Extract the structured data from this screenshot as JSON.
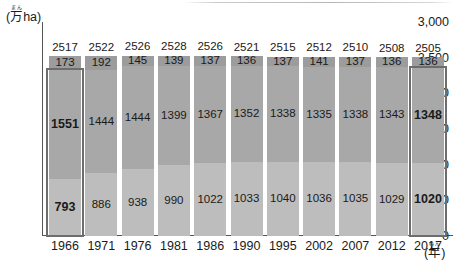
{
  "chart_data": {
    "type": "bar",
    "title": "",
    "ylabel": "(万ha)",
    "ylabel_ruby": "まん",
    "xlabel": "(年)",
    "xlabel_ruby": "ねん",
    "ylim": [
      0,
      3000
    ],
    "yticks": [
      3000,
      2500,
      2000,
      1500,
      1000,
      500,
      0
    ],
    "ytick_labels": [
      "3,000",
      "2,500",
      "2,000",
      "1,500",
      "1,000",
      "500",
      "0"
    ],
    "grid": false,
    "legend": "none",
    "stacked": true,
    "categories": [
      "1966",
      "1971",
      "1976",
      "1981",
      "1986",
      "1990",
      "1995",
      "2002",
      "2007",
      "2012",
      "2017"
    ],
    "totals": [
      2517,
      2522,
      2526,
      2528,
      2526,
      2521,
      2515,
      2512,
      2510,
      2508,
      2505
    ],
    "series": [
      {
        "name": "bottom-segment",
        "values": [
          793,
          886,
          938,
          990,
          1022,
          1033,
          1040,
          1036,
          1035,
          1029,
          1020
        ]
      },
      {
        "name": "middle-segment",
        "values": [
          1551,
          1444,
          1444,
          1399,
          1367,
          1352,
          1338,
          1335,
          1338,
          1343,
          1348
        ]
      },
      {
        "name": "top-segment",
        "values": [
          173,
          192,
          145,
          139,
          137,
          136,
          137,
          141,
          137,
          136,
          136
        ]
      }
    ],
    "highlighted_categories": [
      "1966",
      "2017"
    ],
    "colors": {
      "top_segment": "#9c9c9c",
      "middle_segment": "#a8a8a8",
      "bottom_segment": "#bdbdbd",
      "highlight_outline": "#6d6d6d",
      "axis": "#555555",
      "text": "#1a1a1a"
    }
  }
}
